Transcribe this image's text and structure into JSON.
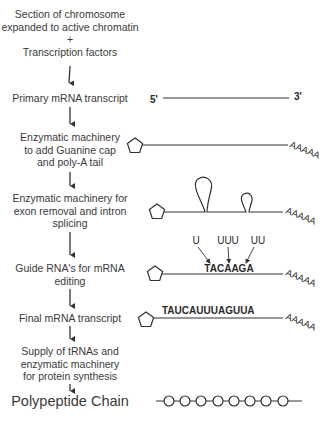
{
  "flow_steps": [
    {
      "id": "chromatin",
      "lines": [
        "Section of chromosome",
        "expanded to active chromatin",
        "+",
        "Transcription factors"
      ]
    },
    {
      "id": "primary-transcript",
      "lines": [
        "Primary mRNA transcript"
      ]
    },
    {
      "id": "cap-tail",
      "lines": [
        "Enzymatic machinery",
        "to add Guanine cap",
        "and poly-A tail"
      ]
    },
    {
      "id": "splicing",
      "lines": [
        "Enzymatic machinery for",
        "exon removal and intron",
        "splicing"
      ]
    },
    {
      "id": "editing",
      "lines": [
        "Guide RNA's for mRNA",
        "editing"
      ]
    },
    {
      "id": "final-transcript",
      "lines": [
        "Final mRNA transcript"
      ]
    },
    {
      "id": "trna-supply",
      "lines": [
        "Supply of tRNAs and",
        "enzymatic machinery",
        "for protein synthesis"
      ]
    },
    {
      "id": "polypeptide",
      "lines": [
        "Polypeptide Chain"
      ]
    }
  ],
  "diagram_labels": {
    "five_prime": "5'",
    "three_prime": "3'",
    "poly_a_tail": "AAAAA",
    "edit_insertions": [
      "U",
      "UUU",
      "UU"
    ],
    "pre_edit_sequence": "TACAAGA",
    "final_sequence": "TAUCAUUUAGUUA"
  },
  "colors": {
    "ink": "#333333",
    "background": "#ffffff"
  },
  "polypeptide_residue_count": 8
}
